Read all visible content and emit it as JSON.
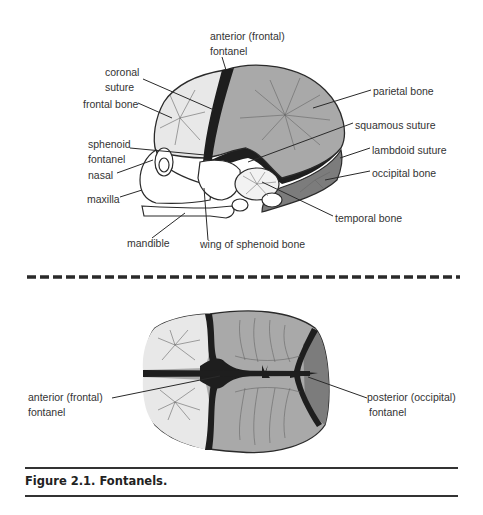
{
  "figure": {
    "caption": "Figure 2.1. Fontanels.",
    "colors": {
      "frontal_bone": "#e8e8e8",
      "parietal_bone": "#a9a9a9",
      "occipital_bone": "#7c7c7c",
      "fontanel": "#1e1e1e",
      "outline": "#2a2a2a",
      "label_text": "#333333"
    }
  },
  "lateral_view": {
    "labels": {
      "anterior_fontanel_l1": "anterior (frontal)",
      "anterior_fontanel_l2": "fontanel",
      "coronal_l1": "coronal",
      "coronal_l2": "suture",
      "frontal_bone": "frontal bone",
      "parietal_bone": "parietal bone",
      "sphenoid_l1": "sphenoid",
      "sphenoid_l2": "fontanel",
      "squamous_suture": "squamous suture",
      "lambdoid_suture": "lambdoid suture",
      "nasal": "nasal",
      "occipital_bone": "occipital bone",
      "maxilla": "maxilla",
      "temporal_bone": "temporal bone",
      "mandible": "mandible",
      "wing_sphenoid": "wing of sphenoid bone"
    }
  },
  "top_view": {
    "labels": {
      "anterior_l1": "anterior (frontal)",
      "anterior_l2": "fontanel",
      "posterior_l1": "posterior (occipital)",
      "posterior_l2": "fontanel"
    }
  }
}
